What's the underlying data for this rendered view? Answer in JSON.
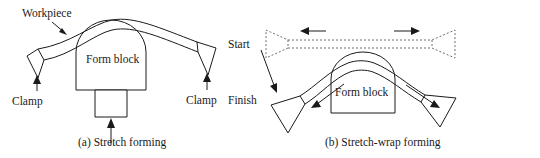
{
  "figure": {
    "panels": [
      {
        "id": "panel-a",
        "caption": "(a) Stretch forming",
        "labels": {
          "workpiece": "Workpiece",
          "form_block": "Form block",
          "clamp_left": "Clamp",
          "clamp_right": "Clamp"
        }
      },
      {
        "id": "panel-b",
        "caption": "(b) Stretch-wrap forming",
        "labels": {
          "start": "Start",
          "finish": "Finish",
          "form_block": "Form block"
        }
      }
    ]
  },
  "colors": {
    "ink": "#1a1a1a",
    "ghost": "#6e6e6e",
    "background": "#ffffff"
  }
}
